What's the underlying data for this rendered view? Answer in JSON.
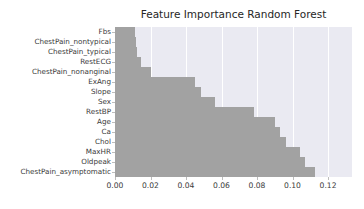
{
  "chart_data": {
    "type": "bar",
    "orientation": "horizontal",
    "title": "Feature Importance Random Forest",
    "xlabel": "",
    "ylabel": "",
    "categories": [
      "Fbs",
      "ChestPain_nontypical",
      "ChestPain_typical",
      "RestECG",
      "ChestPain_nonanginal",
      "ExAng",
      "Slope",
      "Sex",
      "RestBP",
      "Age",
      "Ca",
      "Chol",
      "MaxHR",
      "Oldpeak",
      "ChestPain_asymptomatic"
    ],
    "values": [
      0.0114,
      0.012,
      0.0122,
      0.0146,
      0.02,
      0.0448,
      0.0484,
      0.0566,
      0.0782,
      0.0904,
      0.0932,
      0.0962,
      0.1042,
      0.107,
      0.1128
    ],
    "xlim": [
      0.0,
      0.1335
    ],
    "xticks": [
      0.0,
      0.02,
      0.04,
      0.06,
      0.08,
      0.1,
      0.12
    ],
    "xtick_labels": [
      "0.00",
      "0.02",
      "0.04",
      "0.06",
      "0.08",
      "0.10",
      "0.12"
    ],
    "grid": true,
    "grid_axis": "x",
    "legend": null,
    "style": "seaborn-darkgrid-grayscale",
    "colors": {
      "bar": "#a2a2a2",
      "plot_background": "#eaeaf2",
      "gridline": "#ffffff",
      "figure_background": "#ffffff",
      "text": "#3a3a3a",
      "title_text": "#262626"
    }
  }
}
